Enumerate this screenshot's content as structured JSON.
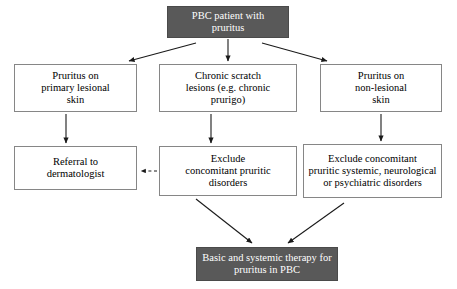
{
  "diagram": {
    "colors": {
      "dark_box_fill": "#595959",
      "dark_box_text": "#ffffff",
      "light_box_fill": "#ffffff",
      "light_box_border": "#868686",
      "light_box_text": "#000000",
      "arrow": "#1a1a1a",
      "background": "#ffffff"
    },
    "nodes": {
      "root": {
        "label": "PBC patient with\npruritus",
        "style": "dark"
      },
      "lesional": {
        "label": "Pruritus on\nprimary lesional\nskin",
        "style": "light"
      },
      "scratch": {
        "label": "Chronic scratch\nlesions (e.g. chronic\nprurigo)",
        "style": "light"
      },
      "nonlesional": {
        "label": "Pruritus on\nnon-lesional\nskin",
        "style": "light"
      },
      "referral": {
        "label": "Referral to\ndermatologist",
        "style": "light"
      },
      "exclude_pruritic": {
        "label": "Exclude\nconcomitant pruritic\ndisorders",
        "style": "light"
      },
      "exclude_systemic": {
        "label": "Exclude concomitant\npruritic systemic, neurological\nor psychiatric disorders",
        "style": "light"
      },
      "therapy": {
        "label": "Basic and systemic therapy for\npruritus in PBC",
        "style": "dark"
      }
    },
    "edges": [
      {
        "name": "root-to-lesional",
        "from": "root",
        "to": "lesional",
        "style": "solid",
        "direction": "diagonal-left"
      },
      {
        "name": "root-to-scratch",
        "from": "root",
        "to": "scratch",
        "style": "solid",
        "direction": "down"
      },
      {
        "name": "root-to-nonlesional",
        "from": "root",
        "to": "nonlesional",
        "style": "solid",
        "direction": "diagonal-right"
      },
      {
        "name": "lesional-to-referral",
        "from": "lesional",
        "to": "referral",
        "style": "solid",
        "direction": "down"
      },
      {
        "name": "scratch-to-exclude",
        "from": "scratch",
        "to": "exclude_pruritic",
        "style": "solid",
        "direction": "down"
      },
      {
        "name": "nonlesional-to-exclude",
        "from": "nonlesional",
        "to": "exclude_systemic",
        "style": "solid",
        "direction": "down"
      },
      {
        "name": "exclude-to-referral",
        "from": "exclude_pruritic",
        "to": "referral",
        "style": "dashed",
        "direction": "left"
      },
      {
        "name": "exclude-to-therapy",
        "from": "exclude_pruritic",
        "to": "therapy",
        "style": "solid",
        "direction": "diagonal-right-down"
      },
      {
        "name": "systemic-to-therapy",
        "from": "exclude_systemic",
        "to": "therapy",
        "style": "solid",
        "direction": "diagonal-left-down"
      }
    ]
  }
}
